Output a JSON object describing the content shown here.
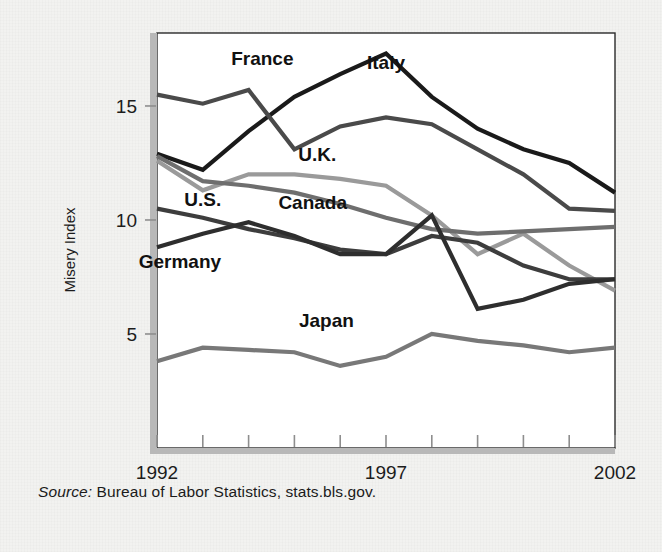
{
  "figure": {
    "source_prefix": "Source:",
    "source_text": "Bureau of Labor Statistics, stats.bls.gov."
  },
  "chart_data": {
    "type": "line",
    "title": "",
    "xlabel": "",
    "ylabel": "Misery Index",
    "xlim": [
      1992,
      2002
    ],
    "ylim": [
      0,
      18.2
    ],
    "grid": false,
    "legend": "inline-labels",
    "x": [
      1992,
      1993,
      1994,
      1995,
      1996,
      1997,
      1998,
      1999,
      2000,
      2001,
      2002
    ],
    "xticks": [
      1992,
      1993,
      1994,
      1995,
      1996,
      1997,
      1998,
      1999,
      2000,
      2001,
      2002
    ],
    "xtick_labels": [
      "1992",
      "",
      "",
      "",
      "",
      "1997",
      "",
      "",
      "",
      "",
      "2002"
    ],
    "yticks": [
      5,
      10,
      15
    ],
    "ytick_labels": [
      "5",
      "10",
      "15"
    ],
    "series": [
      {
        "name": "Italy",
        "color": "#1a1a1a",
        "label_x": 1997.0,
        "label_y": 16.6,
        "values": [
          12.9,
          12.2,
          13.9,
          15.4,
          16.4,
          17.3,
          15.4,
          14.0,
          13.1,
          12.5,
          11.2
        ]
      },
      {
        "name": "France",
        "color": "#4a4a4a",
        "label_x": 1994.3,
        "label_y": 16.8,
        "values": [
          15.5,
          15.1,
          15.7,
          13.1,
          14.1,
          14.5,
          14.2,
          13.1,
          12.0,
          10.5,
          10.4
        ]
      },
      {
        "name": "U.K.",
        "color": "#9a9a9a",
        "label_x": 1995.5,
        "label_y": 12.6,
        "values": [
          12.6,
          11.3,
          12.0,
          12.0,
          11.8,
          11.5,
          10.2,
          8.5,
          9.4,
          8.0,
          6.9
        ]
      },
      {
        "name": "Canada",
        "color": "#6e6e6e",
        "label_x": 1995.4,
        "label_y": 10.5,
        "values": [
          12.8,
          11.7,
          11.5,
          11.2,
          10.7,
          10.1,
          9.6,
          9.4,
          9.5,
          9.6,
          9.7
        ]
      },
      {
        "name": "U.S.",
        "color": "#3d3d3d",
        "label_x": 1993.0,
        "label_y": 10.6,
        "values": [
          10.5,
          10.1,
          9.6,
          9.2,
          8.7,
          8.5,
          9.3,
          9.0,
          8.0,
          7.4,
          7.4
        ]
      },
      {
        "name": "Germany",
        "color": "#2e2e2e",
        "label_x": 1992.5,
        "label_y": 7.9,
        "values": [
          8.8,
          9.4,
          9.9,
          9.3,
          8.5,
          8.5,
          10.2,
          6.1,
          6.5,
          7.2,
          7.4
        ]
      },
      {
        "name": "Japan",
        "color": "#787878",
        "label_x": 1995.7,
        "label_y": 5.3,
        "values": [
          3.8,
          4.4,
          4.3,
          4.2,
          3.6,
          4.0,
          5.0,
          4.7,
          4.5,
          4.2,
          4.4
        ]
      }
    ]
  }
}
